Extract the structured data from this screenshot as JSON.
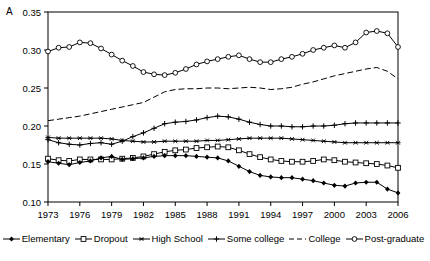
{
  "panel": {
    "label": "A"
  },
  "axes": {
    "y_ticks": [
      "0.10",
      "0.15",
      "0.20",
      "0.25",
      "0.30",
      "0.35"
    ],
    "x_ticks": [
      "1973",
      "1976",
      "1979",
      "1982",
      "1985",
      "1988",
      "1991",
      "1994",
      "1997",
      "2000",
      "2003",
      "2006"
    ]
  },
  "legend": [
    {
      "label": "Elementary",
      "marker": "filled-diamond-marker",
      "dash": "solid"
    },
    {
      "label": "Dropout",
      "marker": "open-square-marker",
      "dash": "solid"
    },
    {
      "label": "High School",
      "marker": "asterisk-marker",
      "dash": "solid"
    },
    {
      "label": "Some college",
      "marker": "cross-marker",
      "dash": "solid"
    },
    {
      "label": "College",
      "marker": "no-marker",
      "dash": "dashed"
    },
    {
      "label": "Post-graduate",
      "marker": "open-circle-marker",
      "dash": "solid"
    }
  ],
  "chart_data": {
    "type": "line",
    "title": "",
    "xlabel": "",
    "ylabel": "",
    "xlim": [
      1973,
      2006
    ],
    "ylim": [
      0.1,
      0.35
    ],
    "grid": false,
    "legend_position": "bottom",
    "x": [
      1973,
      1974,
      1975,
      1976,
      1977,
      1978,
      1979,
      1980,
      1981,
      1982,
      1983,
      1984,
      1985,
      1986,
      1987,
      1988,
      1989,
      1990,
      1991,
      1992,
      1993,
      1994,
      1995,
      1996,
      1997,
      1998,
      1999,
      2000,
      2001,
      2002,
      2003,
      2004,
      2005,
      2006
    ],
    "series": [
      {
        "name": "Post-graduate",
        "marker": "open-circle-marker",
        "dash": "solid",
        "values": [
          0.298,
          0.303,
          0.304,
          0.31,
          0.309,
          0.302,
          0.294,
          0.286,
          0.279,
          0.271,
          0.268,
          0.267,
          0.27,
          0.275,
          0.281,
          0.285,
          0.288,
          0.291,
          0.293,
          0.288,
          0.284,
          0.284,
          0.288,
          0.291,
          0.295,
          0.3,
          0.303,
          0.306,
          0.303,
          0.31,
          0.323,
          0.325,
          0.322,
          0.304
        ]
      },
      {
        "name": "College",
        "marker": "no-marker",
        "dash": "dashed",
        "values": [
          0.207,
          0.209,
          0.211,
          0.213,
          0.216,
          0.219,
          0.222,
          0.225,
          0.228,
          0.231,
          0.238,
          0.245,
          0.248,
          0.249,
          0.249,
          0.25,
          0.25,
          0.249,
          0.25,
          0.251,
          0.25,
          0.248,
          0.249,
          0.251,
          0.255,
          0.258,
          0.262,
          0.266,
          0.269,
          0.272,
          0.275,
          0.277,
          0.272,
          0.262
        ]
      },
      {
        "name": "Some college",
        "marker": "cross-marker",
        "dash": "solid",
        "values": [
          0.182,
          0.178,
          0.176,
          0.175,
          0.177,
          0.178,
          0.176,
          0.18,
          0.186,
          0.191,
          0.197,
          0.203,
          0.205,
          0.206,
          0.208,
          0.211,
          0.213,
          0.212,
          0.209,
          0.205,
          0.202,
          0.2,
          0.2,
          0.199,
          0.199,
          0.2,
          0.2,
          0.201,
          0.203,
          0.204,
          0.204,
          0.204,
          0.204,
          0.204
        ]
      },
      {
        "name": "High School",
        "marker": "asterisk-marker",
        "dash": "solid",
        "values": [
          0.185,
          0.184,
          0.184,
          0.184,
          0.184,
          0.184,
          0.183,
          0.181,
          0.18,
          0.179,
          0.179,
          0.18,
          0.18,
          0.18,
          0.18,
          0.181,
          0.181,
          0.182,
          0.183,
          0.184,
          0.184,
          0.184,
          0.184,
          0.183,
          0.182,
          0.181,
          0.18,
          0.179,
          0.178,
          0.178,
          0.178,
          0.178,
          0.178,
          0.178
        ]
      },
      {
        "name": "Dropout",
        "marker": "open-square-marker",
        "dash": "solid",
        "values": [
          0.157,
          0.155,
          0.154,
          0.156,
          0.156,
          0.156,
          0.156,
          0.157,
          0.158,
          0.16,
          0.163,
          0.166,
          0.168,
          0.169,
          0.171,
          0.172,
          0.173,
          0.172,
          0.168,
          0.163,
          0.159,
          0.156,
          0.154,
          0.153,
          0.153,
          0.154,
          0.156,
          0.155,
          0.153,
          0.152,
          0.151,
          0.15,
          0.148,
          0.145
        ]
      },
      {
        "name": "Elementary",
        "marker": "filled-diamond-marker",
        "dash": "solid",
        "values": [
          0.153,
          0.151,
          0.149,
          0.152,
          0.154,
          0.158,
          0.16,
          0.156,
          0.157,
          0.158,
          0.16,
          0.161,
          0.161,
          0.161,
          0.16,
          0.159,
          0.158,
          0.154,
          0.147,
          0.14,
          0.135,
          0.133,
          0.132,
          0.132,
          0.13,
          0.128,
          0.125,
          0.122,
          0.121,
          0.125,
          0.126,
          0.126,
          0.117,
          0.112
        ]
      }
    ]
  }
}
